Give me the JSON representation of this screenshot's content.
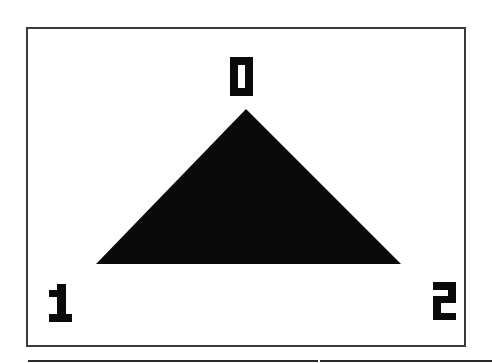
{
  "diagram": {
    "type": "triangle-vertex-labeling",
    "shape": {
      "name": "filled-triangle",
      "fill_color": "#0a0a0a",
      "vertices": [
        {
          "index": 0,
          "label": "0",
          "position": "apex",
          "x": 246,
          "y": 109
        },
        {
          "index": 1,
          "label": "1",
          "position": "bottom-left",
          "x": 96,
          "y": 264
        },
        {
          "index": 2,
          "label": "2",
          "position": "bottom-right",
          "x": 401,
          "y": 264
        }
      ]
    },
    "labels": [
      {
        "text": "0",
        "placement": "above apex",
        "x": 230,
        "y": 57,
        "w": 23,
        "h": 39
      },
      {
        "text": "1",
        "placement": "below-left of left vertex",
        "x": 49,
        "y": 284,
        "w": 23,
        "h": 38
      },
      {
        "text": "2",
        "placement": "below-right of right vertex",
        "x": 433,
        "y": 282,
        "w": 23,
        "h": 38
      }
    ],
    "frame": {
      "x": 26,
      "y": 27,
      "w": 440,
      "h": 320,
      "border_color": "#3a3a3a"
    },
    "colors": {
      "background": "#ffffff",
      "ink": "#0a0a0a",
      "frame": "#3a3a3a"
    }
  }
}
